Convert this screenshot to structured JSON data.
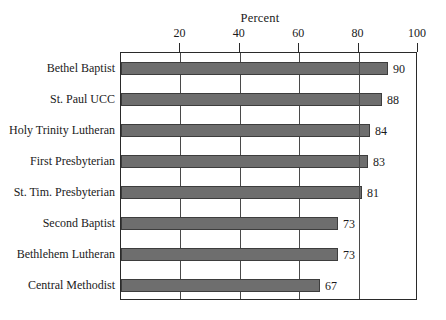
{
  "chart_data": {
    "type": "bar",
    "orientation": "horizontal",
    "title": "Percent",
    "xlabel": "Percent",
    "ylabel": "",
    "categories": [
      "Bethel Baptist",
      "St. Paul UCC",
      "Holy Trinity Lutheran",
      "First Presbyterian",
      "St. Tim. Presbyterian",
      "Second Baptist",
      "Bethlehem Lutheran",
      "Central Methodist"
    ],
    "values": [
      90,
      88,
      84,
      83,
      81,
      73,
      73,
      67
    ],
    "value_labels": [
      "90",
      "88",
      "84",
      "83",
      "81",
      "73",
      "73",
      "67"
    ],
    "xlim": [
      0,
      100
    ],
    "xticks": [
      20,
      40,
      60,
      80,
      100
    ],
    "xtick_labels": [
      "20",
      "40",
      "60",
      "80",
      "100"
    ],
    "grid": true,
    "grid_axis": "x",
    "legend": null,
    "bar_color": "#6e6e6e",
    "bar_border_color": "#3d3d3d",
    "axis_color": "#2a2a2a",
    "grid_color": "#4a4a4a",
    "background": "#ffffff"
  }
}
